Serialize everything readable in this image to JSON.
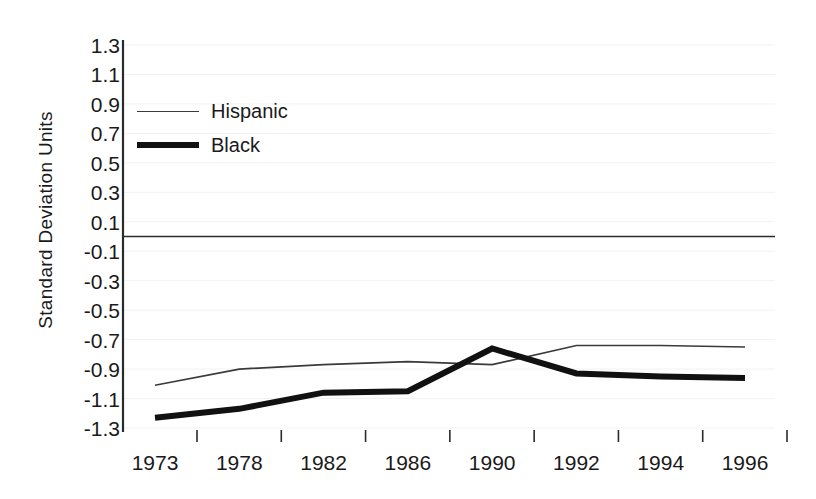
{
  "chart_data": {
    "type": "line",
    "title": "",
    "xlabel": "",
    "ylabel": "Standard Deviation Units",
    "categories": [
      "1973",
      "1978",
      "1982",
      "1986",
      "1990",
      "1992",
      "1994",
      "1996"
    ],
    "ylim": [
      -1.3,
      1.3
    ],
    "yticks": [
      "1.3",
      "1.1",
      "0.9",
      "0.7",
      "0.5",
      "0.3",
      "0.1",
      "-0.1",
      "-0.3",
      "-0.5",
      "-0.7",
      "-0.9",
      "-1.1",
      "-1.3"
    ],
    "ytick_values": [
      1.3,
      1.1,
      0.9,
      0.7,
      0.5,
      0.3,
      0.1,
      -0.1,
      -0.3,
      -0.5,
      -0.7,
      -0.9,
      -1.1,
      -1.3
    ],
    "grid": false,
    "zero_reference_line": 0.0,
    "legend_position": "upper-left",
    "series": [
      {
        "name": "Hispanic",
        "style": "thin",
        "color": "#3a3a3a",
        "values": [
          -1.01,
          -0.9,
          -0.87,
          -0.85,
          -0.87,
          -0.74,
          -0.74,
          -0.75
        ]
      },
      {
        "name": "Black",
        "style": "thick",
        "color": "#111111",
        "values": [
          -1.23,
          -1.17,
          -1.06,
          -1.05,
          -0.76,
          -0.93,
          -0.95,
          -0.96
        ]
      }
    ]
  },
  "legend": {
    "items": [
      {
        "label": "Hispanic"
      },
      {
        "label": "Black"
      }
    ]
  }
}
